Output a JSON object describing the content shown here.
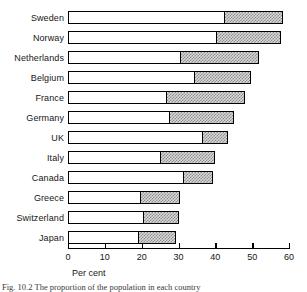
{
  "chart_data": {
    "type": "bar",
    "orientation": "horizontal",
    "stacked": true,
    "title": "",
    "xlabel": "Per cent",
    "ylabel": "",
    "xlim": [
      0,
      60
    ],
    "xticks": [
      0,
      10,
      20,
      30,
      40,
      50,
      60
    ],
    "xtick_labels": [
      "0",
      "10",
      "20",
      "30",
      "40",
      "50",
      "60"
    ],
    "grid": false,
    "legend": "none",
    "categories": [
      "Sweden",
      "Norway",
      "Netherlands",
      "Belgium",
      "France",
      "Germany",
      "UK",
      "Italy",
      "Canada",
      "Greece",
      "Switzerland",
      "Japan"
    ],
    "series": [
      {
        "name": "segment-1",
        "fill": "white",
        "values": [
          42.5,
          40.3,
          30.5,
          34.3,
          26.7,
          27.5,
          36.5,
          25.0,
          31.5,
          19.5,
          20.5,
          19.2
        ]
      },
      {
        "name": "segment-2",
        "fill": "hatched-grey",
        "values": [
          15.8,
          17.4,
          21.3,
          15.4,
          21.3,
          17.5,
          7.0,
          15.0,
          8.0,
          10.9,
          9.5,
          10.0
        ]
      }
    ],
    "totals": [
      58.3,
      57.7,
      51.8,
      49.7,
      48.0,
      45.0,
      43.5,
      40.0,
      39.5,
      30.4,
      30.0,
      29.2
    ]
  },
  "axis": {
    "x_title": "Per cent"
  },
  "caption": {
    "text": "Fig. 10.2   The proportion of the population in each country"
  },
  "colors": {
    "axis": "#000000",
    "bar_outline": "#000000",
    "segment_a": "#ffffff",
    "segment_b": "#d9d9d9",
    "hatch": "#8c8c8c",
    "text": "#161616"
  }
}
